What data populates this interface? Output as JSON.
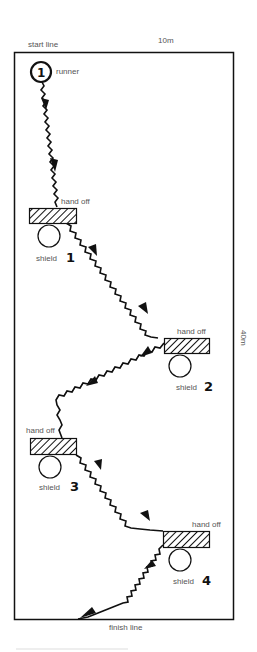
{
  "diagram": {
    "labels": {
      "start_line": "start line",
      "finish_line": "finish line",
      "width": "10m",
      "length": "40m",
      "runner": "runner",
      "runner_number": "1"
    },
    "stations": [
      {
        "id": 1,
        "handoff_label": "hand off",
        "shield_label": "shield",
        "number": "1"
      },
      {
        "id": 2,
        "handoff_label": "hand off",
        "shield_label": "shield",
        "number": "2"
      },
      {
        "id": 3,
        "handoff_label": "hand off",
        "shield_label": "shield",
        "number": "3"
      },
      {
        "id": 4,
        "handoff_label": "hand off",
        "shield_label": "shield",
        "number": "4"
      }
    ],
    "colors": {
      "line": "#111111",
      "label": "#555555",
      "background": "#ffffff"
    }
  }
}
